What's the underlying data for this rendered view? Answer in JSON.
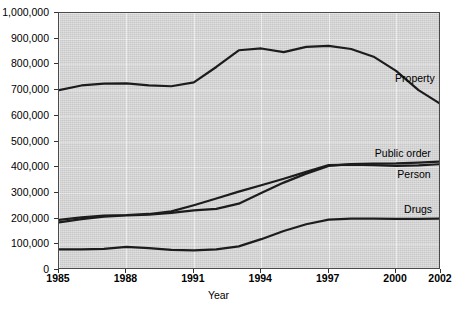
{
  "chart_data": {
    "type": "line",
    "title": "",
    "xlabel": "Year",
    "ylabel": "",
    "xlim": [
      1985,
      2002
    ],
    "ylim": [
      0,
      1000000
    ],
    "grid": true,
    "legend_position": "in-plot-right",
    "x_tick_labels": [
      "1985",
      "1988",
      "1991",
      "1994",
      "1997",
      "2000",
      "2002"
    ],
    "x_tick_values": [
      1985,
      1988,
      1991,
      1994,
      1997,
      2000,
      2002
    ],
    "y_tick_labels": [
      "0",
      "100,000",
      "200,000",
      "300,000",
      "400,000",
      "500,000",
      "600,000",
      "700,000",
      "800,000",
      "900,000",
      "1,000,000"
    ],
    "y_tick_values": [
      0,
      100000,
      200000,
      300000,
      400000,
      500000,
      600000,
      700000,
      800000,
      900000,
      1000000
    ],
    "x": [
      1985,
      1986,
      1987,
      1988,
      1989,
      1990,
      1991,
      1992,
      1993,
      1994,
      1995,
      1996,
      1997,
      1998,
      1999,
      2000,
      2001,
      2002
    ],
    "series": [
      {
        "name": "Property",
        "color": "#1c1c1c",
        "values": [
          700000,
          718000,
          725000,
          726000,
          718000,
          715000,
          730000,
          790000,
          855000,
          862000,
          848000,
          868000,
          872000,
          860000,
          830000,
          775000,
          700000,
          645000
        ]
      },
      {
        "name": "Public order",
        "color": "#1c1c1c",
        "values": [
          185000,
          198000,
          208000,
          212000,
          215000,
          222000,
          232000,
          238000,
          258000,
          300000,
          340000,
          375000,
          405000,
          412000,
          414000,
          415000,
          418000,
          422000
        ]
      },
      {
        "name": "Person",
        "color": "#1c1c1c",
        "values": [
          195000,
          205000,
          212000,
          214000,
          218000,
          228000,
          252000,
          278000,
          305000,
          330000,
          355000,
          382000,
          408000,
          410000,
          408000,
          405000,
          407000,
          412000
        ]
      },
      {
        "name": "Drugs",
        "color": "#1c1c1c",
        "values": [
          80000,
          80000,
          82000,
          90000,
          85000,
          78000,
          76000,
          80000,
          92000,
          120000,
          152000,
          178000,
          196000,
          200000,
          200000,
          199000,
          199000,
          200000
        ]
      }
    ],
    "series_labels": [
      {
        "text": "Property",
        "x": 2000,
        "y": 745000
      },
      {
        "text": "Public order",
        "x": 1999.1,
        "y": 450000
      },
      {
        "text": "Person",
        "x": 2000.1,
        "y": 368000
      },
      {
        "text": "Drugs",
        "x": 2000.4,
        "y": 232000
      }
    ]
  },
  "axis": {
    "x_title": "Year"
  }
}
